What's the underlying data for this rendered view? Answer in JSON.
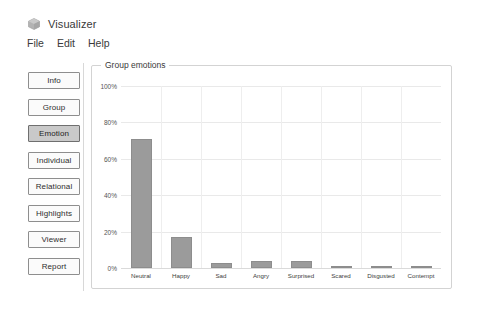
{
  "app": {
    "title": "Visualizer",
    "icon": "cube-icon"
  },
  "menu": {
    "items": [
      {
        "label": "File"
      },
      {
        "label": "Edit"
      },
      {
        "label": "Help"
      }
    ]
  },
  "sidebar": {
    "items": [
      {
        "label": "Info",
        "selected": false
      },
      {
        "label": "Group",
        "selected": false
      },
      {
        "label": "Emotion",
        "selected": true
      },
      {
        "label": "Individual",
        "selected": false
      },
      {
        "label": "Relational",
        "selected": false
      },
      {
        "label": "Highlights",
        "selected": false
      },
      {
        "label": "Viewer",
        "selected": false
      },
      {
        "label": "Report",
        "selected": false
      }
    ]
  },
  "panel": {
    "legend": "Group emotions"
  },
  "colors": {
    "bar_fill": "#9b9b9b",
    "bar_stroke": "#8d8d8d",
    "grid": "#e9e9e9",
    "panel_border": "#d3d3d3",
    "selected_button": "#c9c9c9"
  },
  "chart_data": {
    "type": "bar",
    "title": "Group emotions",
    "xlabel": "",
    "ylabel": "",
    "ylim": [
      0,
      100
    ],
    "yticks": [
      0,
      20,
      40,
      60,
      80,
      100
    ],
    "ytick_labels": [
      "0%",
      "20%",
      "40%",
      "60%",
      "80%",
      "100%"
    ],
    "grid": true,
    "legend": "none",
    "categories": [
      "Neutral",
      "Happy",
      "Sad",
      "Angry",
      "Surprised",
      "Scared",
      "Disgusted",
      "Contempt"
    ],
    "values": [
      71,
      17,
      3,
      4,
      4,
      1,
      1,
      1
    ]
  }
}
